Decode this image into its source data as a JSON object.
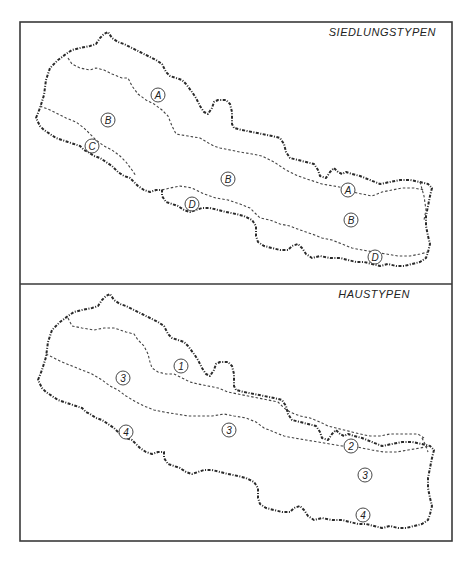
{
  "panels": [
    {
      "title": "SIEDLUNGSTYPEN",
      "labels": [
        {
          "text": "A",
          "x": 158,
          "y": 95
        },
        {
          "text": "B",
          "x": 108,
          "y": 120
        },
        {
          "text": "C",
          "x": 92,
          "y": 146
        },
        {
          "text": "B",
          "x": 228,
          "y": 179
        },
        {
          "text": "D",
          "x": 192,
          "y": 204
        },
        {
          "text": "A",
          "x": 348,
          "y": 190
        },
        {
          "text": "B",
          "x": 351,
          "y": 220
        },
        {
          "text": "D",
          "x": 375,
          "y": 257
        }
      ]
    },
    {
      "title": "HAUSTYPEN",
      "labels": [
        {
          "text": "1",
          "x": 181,
          "y": 366
        },
        {
          "text": "3",
          "x": 123,
          "y": 378
        },
        {
          "text": "4",
          "x": 126,
          "y": 432
        },
        {
          "text": "3",
          "x": 229,
          "y": 430
        },
        {
          "text": "2",
          "x": 351,
          "y": 446
        },
        {
          "text": "3",
          "x": 365,
          "y": 475
        },
        {
          "text": "4",
          "x": 363,
          "y": 515
        }
      ]
    }
  ],
  "colors": {
    "ink": "#2a2a2a",
    "paper": "#ffffff"
  }
}
